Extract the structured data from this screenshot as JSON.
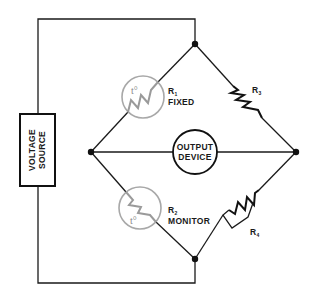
{
  "diagram": {
    "type": "wheatstone-bridge-circuit",
    "voltage_source": {
      "line1": "VOLTAGE",
      "line2": "SOURCE"
    },
    "output_device": {
      "line1": "OUTPUT",
      "line2": "DEVICE"
    },
    "resistors": [
      {
        "id": "R1",
        "letter": "R",
        "sub": "1",
        "desc": "FIXED",
        "kind": "thermistor",
        "symbol": "t°"
      },
      {
        "id": "R2",
        "letter": "R",
        "sub": "2",
        "desc": "MONITOR",
        "kind": "thermistor",
        "symbol": "t°"
      },
      {
        "id": "R3",
        "letter": "R",
        "sub": "3",
        "kind": "resistor"
      },
      {
        "id": "R4",
        "letter": "R",
        "sub": "4",
        "kind": "variable-resistor"
      }
    ],
    "nodes": [
      "top",
      "left",
      "right",
      "bottom"
    ],
    "colors": {
      "wire": "#1a1a1a",
      "thermistor": "#a8a8a8",
      "background": "#ffffff"
    }
  }
}
